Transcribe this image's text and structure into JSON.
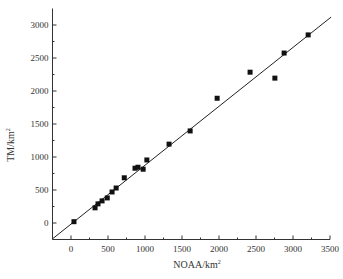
{
  "chart_data": {
    "type": "scatter",
    "title": "",
    "xlabel": "NOAA/km",
    "xlabel_sup": "2",
    "ylabel": "TM/km",
    "ylabel_sup": "2",
    "xlim": [
      -250,
      3500
    ],
    "ylim": [
      -250,
      3250
    ],
    "xticks": [
      0,
      500,
      1000,
      1500,
      2000,
      2500,
      3000,
      3500
    ],
    "yticks": [
      0,
      500,
      1000,
      1500,
      2000,
      2500,
      3000
    ],
    "grid": false,
    "legend": null,
    "series": [
      {
        "name": "observations",
        "marker": "square",
        "points": [
          [
            40,
            20
          ],
          [
            325,
            230
          ],
          [
            365,
            290
          ],
          [
            420,
            335
          ],
          [
            490,
            380
          ],
          [
            555,
            470
          ],
          [
            610,
            530
          ],
          [
            720,
            685
          ],
          [
            865,
            830
          ],
          [
            905,
            845
          ],
          [
            975,
            815
          ],
          [
            1025,
            955
          ],
          [
            1325,
            1195
          ],
          [
            1610,
            1395
          ],
          [
            1975,
            1890
          ],
          [
            2420,
            2285
          ],
          [
            2755,
            2195
          ],
          [
            2880,
            2575
          ],
          [
            3205,
            2850
          ]
        ]
      },
      {
        "name": "fit line",
        "type": "line",
        "points": [
          [
            -250,
            -240
          ],
          [
            3515,
            3120
          ]
        ]
      }
    ]
  }
}
